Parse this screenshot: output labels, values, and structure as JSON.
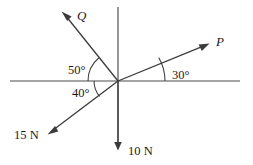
{
  "figure": {
    "background_color": "#ffffff",
    "line_color": "#3b3b3b",
    "axis_color": "#4a4a4a",
    "text_color": "#1a1a1a",
    "origin": {
      "x": 118,
      "y": 81
    }
  },
  "axes": {
    "horizontal": {
      "label": "horizontal-axis",
      "x1": 10,
      "y1": 81,
      "x2": 240,
      "y2": 81
    },
    "vertical": {
      "label": "vertical-axis",
      "x1": 118,
      "y1": 7,
      "x2": 118,
      "y2": 150
    }
  },
  "vectors": [
    {
      "id": "P",
      "label": "P",
      "label_x": 216,
      "label_y": 46,
      "angle_from_horizontal_deg": 30,
      "direction": "up-right",
      "tip": {
        "x": 208,
        "y": 44
      },
      "tail": {
        "x": 118,
        "y": 81
      }
    },
    {
      "id": "Q",
      "label": "Q",
      "label_x": 77,
      "label_y": 20,
      "angle_from_horizontal_deg": 50,
      "direction": "up-left",
      "tip": {
        "x": 62,
        "y": 12
      },
      "tail": {
        "x": 118,
        "y": 81
      }
    },
    {
      "id": "F15",
      "label": "15 N",
      "label_x": 14,
      "label_y": 139,
      "angle_from_horizontal_deg": 40,
      "direction": "down-left",
      "tip": {
        "x": 48,
        "y": 133
      },
      "tail": {
        "x": 118,
        "y": 81
      }
    },
    {
      "id": "F10",
      "label": "10 N",
      "label_x": 128,
      "label_y": 155,
      "angle_from_horizontal_deg": 90,
      "direction": "down",
      "tip": {
        "x": 118,
        "y": 150
      },
      "tail": {
        "x": 118,
        "y": 81
      }
    }
  ],
  "angle_marks": [
    {
      "id": "angle-50",
      "label": "50°",
      "value": 50,
      "unit": "degrees",
      "label_x": 68,
      "label_y": 74,
      "measured_from": "negative-x-axis",
      "measured_to": "Q",
      "arc_radius": 30
    },
    {
      "id": "angle-40",
      "label": "40°",
      "value": 40,
      "unit": "degrees",
      "label_x": 72,
      "label_y": 97,
      "measured_from": "negative-x-axis",
      "measured_to": "15 N",
      "arc_radius": 24
    },
    {
      "id": "angle-30",
      "label": "30°",
      "value": 30,
      "unit": "degrees",
      "label_x": 172,
      "label_y": 79,
      "measured_from": "positive-x-axis",
      "measured_to": "P",
      "arc_radius": 47
    }
  ]
}
